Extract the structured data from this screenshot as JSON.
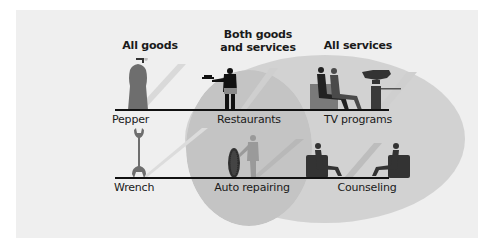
{
  "headings": {
    "goods": "All goods",
    "both_line1": "Both goods",
    "both_line2": "and services",
    "services": "All services"
  },
  "items": {
    "row1": [
      {
        "label": "Pepper",
        "icon": "pepper-grinder-icon",
        "category": "goods"
      },
      {
        "label": "Restaurants",
        "icon": "waiter-icon",
        "category": "both"
      },
      {
        "label": "TV programs",
        "icon": "tv-viewers-camera-icon",
        "category": "services"
      }
    ],
    "row2": [
      {
        "label": "Wrench",
        "icon": "wrench-icon",
        "category": "goods"
      },
      {
        "label": "Auto repairing",
        "icon": "mechanic-tire-icon",
        "category": "both"
      },
      {
        "label": "Counseling",
        "icon": "counseling-chairs-icon",
        "category": "services"
      }
    ]
  },
  "colors": {
    "background": "#efefef",
    "services_ellipse": "#d2d2d2",
    "both_region": "#c4c4c4",
    "goods_figure": "#6e6e6e",
    "dark_figure": "#2c2c2c",
    "shadow": "#d8d8d8"
  }
}
